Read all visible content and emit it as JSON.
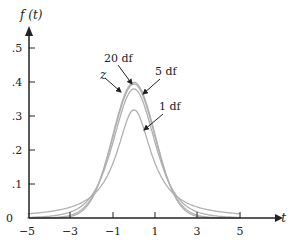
{
  "chart_data": {
    "type": "line",
    "title": "",
    "xlabel": "t",
    "ylabel": "f (t)",
    "xlim": [
      -5,
      5.8
    ],
    "ylim": [
      0,
      0.55
    ],
    "xticks": [
      -5,
      -3,
      -1,
      1,
      3,
      5
    ],
    "xtick_labels": [
      "−5",
      "−3",
      "−1",
      "1",
      "3",
      "5"
    ],
    "yticks": [
      0,
      0.1,
      0.2,
      0.3,
      0.4,
      0.5
    ],
    "ytick_labels": [
      "0",
      ".1",
      ".2",
      ".3",
      ".4",
      ".5"
    ],
    "grid": false,
    "legend": null,
    "series": [
      {
        "name": "z",
        "distribution": "standard normal",
        "peak": 0.399
      },
      {
        "name": "20 df",
        "distribution": "t",
        "df": 20,
        "peak": 0.394
      },
      {
        "name": "5 df",
        "distribution": "t",
        "df": 5,
        "peak": 0.38
      },
      {
        "name": "1 df",
        "distribution": "t",
        "df": 1,
        "peak": 0.318
      }
    ],
    "annotations": [
      {
        "text": "z",
        "points_to": "z curve"
      },
      {
        "text": "20 df",
        "points_to": "20 df curve"
      },
      {
        "text": "5 df",
        "points_to": "5 df curve"
      },
      {
        "text": "1 df",
        "points_to": "1 df curve"
      }
    ],
    "line_color": "#b0b0b0",
    "axis_color": "#222222"
  },
  "labels": {
    "y_axis": "f (t)",
    "x_axis": "t",
    "annot_z": "z",
    "annot_20": "20 df",
    "annot_5": "5 df",
    "annot_1": "1 df",
    "xt": [
      "−5",
      "−3",
      "−1",
      "1",
      "3",
      "5"
    ],
    "yt": [
      "0",
      ".1",
      ".2",
      ".3",
      ".4",
      ".5"
    ]
  }
}
